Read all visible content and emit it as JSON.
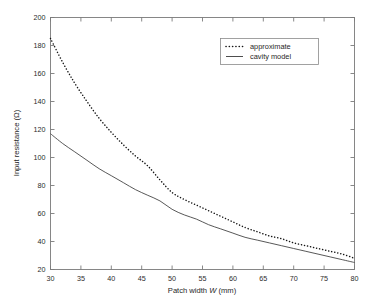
{
  "chart_data": {
    "type": "line",
    "title": "",
    "xlabel": "Patch width W (mm)",
    "xlabel_parts": {
      "prefix": "Patch width ",
      "italic": "W",
      "suffix": " (mm)"
    },
    "ylabel": "Input resistance (Ω)",
    "xlim": [
      30,
      80
    ],
    "ylim": [
      20,
      200
    ],
    "xticks": [
      30,
      35,
      40,
      45,
      50,
      55,
      60,
      65,
      70,
      75,
      80
    ],
    "yticks": [
      20,
      40,
      60,
      80,
      100,
      120,
      140,
      160,
      180,
      200
    ],
    "grid": false,
    "legend_position": "upper right",
    "x": [
      30,
      32,
      34,
      36,
      38,
      40,
      42,
      44,
      46,
      48,
      50,
      52,
      54,
      56,
      58,
      60,
      62,
      64,
      66,
      68,
      70,
      72,
      74,
      76,
      78,
      80
    ],
    "series": [
      {
        "name": "approximate",
        "style": "dotted",
        "color": "#161616",
        "values": [
          185,
          168,
          153,
          140,
          128,
          118,
          109,
          101,
          94,
          84,
          75,
          70,
          66,
          62,
          58,
          54,
          50,
          47,
          44,
          42,
          39,
          37,
          35,
          33,
          31,
          28
        ]
      },
      {
        "name": "cavity model",
        "style": "solid",
        "color": "#3a3a3a",
        "values": [
          117,
          110,
          104,
          98,
          92,
          87,
          82,
          77,
          73,
          69,
          63,
          59,
          56,
          52,
          49,
          46,
          43,
          41,
          39,
          37,
          35,
          33,
          31,
          29,
          27,
          25
        ]
      }
    ],
    "legend": [
      {
        "label": "approximate",
        "style": "dotted"
      },
      {
        "label": "cavity model",
        "style": "solid"
      }
    ],
    "colors": {
      "background": "#ffffff",
      "frame": "#7a7a7a",
      "text": "#1f1f1f"
    }
  },
  "axis": {
    "x_tick_labels": [
      "30",
      "35",
      "40",
      "45",
      "50",
      "55",
      "60",
      "65",
      "70",
      "75",
      "80"
    ],
    "y_tick_labels": [
      "20",
      "40",
      "60",
      "80",
      "100",
      "120",
      "140",
      "160",
      "180",
      "200"
    ]
  }
}
